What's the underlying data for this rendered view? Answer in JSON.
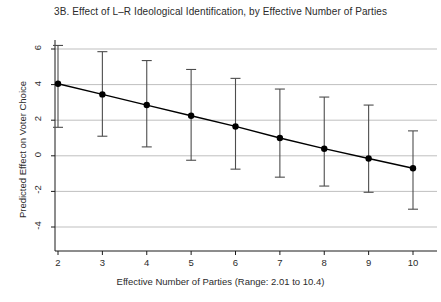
{
  "chart_data": {
    "type": "line",
    "title": "3B. Effect of L–R Ideological Identification, by Effective Number of Parties",
    "xlabel": "Effective Number of Parties (Range: 2.01 to 10.4)",
    "ylabel": "Predicted Effect on Voter Choice",
    "xlim": [
      1.55,
      10.45
    ],
    "ylim": [
      -4,
      6.6
    ],
    "xticks": [
      2,
      3,
      4,
      5,
      6,
      7,
      8,
      9,
      10
    ],
    "xtick_labels": [
      "2",
      "3",
      "4",
      "5",
      "6",
      "7",
      "8",
      "9",
      "10"
    ],
    "yticks": [
      6,
      4,
      2,
      0,
      -2,
      -4
    ],
    "ytick_labels": [
      "6",
      "4",
      "2",
      "0",
      "-2",
      "-4"
    ],
    "grid": "horizontal",
    "grid_color": "#b8b8b8",
    "line_color": "#000000",
    "marker_color": "#000000",
    "errorbar_color": "#4d4d4d",
    "x": [
      2,
      3,
      4,
      5,
      6,
      7,
      8,
      9,
      10
    ],
    "values": [
      4.05,
      3.45,
      2.85,
      2.25,
      1.65,
      1.0,
      0.4,
      -0.15,
      -0.7
    ],
    "ci_upper": [
      6.2,
      5.85,
      5.35,
      4.85,
      4.35,
      3.75,
      3.3,
      2.85,
      1.4
    ],
    "ci_lower": [
      1.6,
      1.1,
      0.5,
      -0.25,
      -0.75,
      -1.2,
      -1.7,
      -2.05,
      -3.0
    ],
    "series_name": "Predicted effect with 95% confidence interval",
    "annotations": []
  }
}
